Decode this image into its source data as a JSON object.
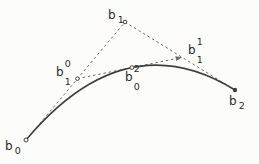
{
  "diagram": {
    "type": "bezier-de-casteljau",
    "background": "#fcfcfb",
    "curve_color": "#3f3f3f",
    "dash_color": "#6b6b6b",
    "marker_fill": "#fcfcfb",
    "label_color": "#2b2b2b",
    "t": 0.52,
    "control_points": {
      "b0": {
        "x": 26,
        "y": 140
      },
      "b1": {
        "x": 125,
        "y": 22
      },
      "b2": {
        "x": 235,
        "y": 90
      }
    },
    "labels": [
      {
        "id": "b0",
        "base": "b",
        "sup": "",
        "sub": "0",
        "x": 5,
        "y": 141
      },
      {
        "id": "b1",
        "base": "b",
        "sup": "",
        "sub": "1",
        "x": 108,
        "y": 10
      },
      {
        "id": "b2",
        "base": "b",
        "sup": "",
        "sub": "2",
        "x": 229,
        "y": 96
      },
      {
        "id": "b10",
        "base": "b",
        "sup": "0",
        "sub": "1",
        "x": 56,
        "y": 59
      },
      {
        "id": "b11",
        "base": "b",
        "sup": "1",
        "sub": "1",
        "x": 188,
        "y": 37
      },
      {
        "id": "b02",
        "base": "b",
        "sup": "2",
        "sub": "0",
        "x": 125,
        "y": 64
      }
    ]
  }
}
